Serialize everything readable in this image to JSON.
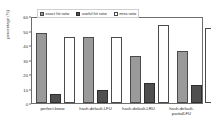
{
  "chart_data": {
    "type": "bar",
    "title": "",
    "xlabel": "",
    "ylabel": "percentage (%)",
    "ylim": [
      0,
      60
    ],
    "yticks": [
      0,
      10,
      20,
      30,
      40,
      50,
      60
    ],
    "grid": false,
    "legend_position": "top-left",
    "categories": [
      "perfect-know",
      "hash-default-LFU",
      "hash-default-LRU",
      "hash-default-partialLFU"
    ],
    "series": [
      {
        "name": "exact hit ratio",
        "color": "#9a9a9a",
        "values": [
          48,
          45.5,
          32.5,
          36
        ]
      },
      {
        "name": "useful hit ratio",
        "color": "#4f4f4f",
        "values": [
          6.5,
          9,
          14,
          12.5
        ]
      },
      {
        "name": "miss ratio",
        "color": "#ffffff",
        "values": [
          45.5,
          45.5,
          53.5,
          52
        ]
      }
    ]
  }
}
